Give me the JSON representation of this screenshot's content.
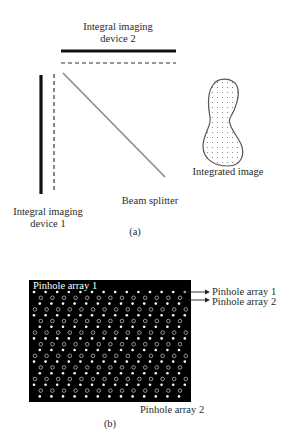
{
  "figure_a": {
    "caption": "(a)",
    "device2_label_line1": "Integral imaging",
    "device2_label_line2": "device 2",
    "device1_label_line1": "Integral imaging",
    "device1_label_line2": "device 1",
    "beam_splitter_label": "Beam splitter",
    "integrated_image_label": "Integrated image"
  },
  "figure_b": {
    "caption": "(b)",
    "inside_label": "Pinhole array 1",
    "arrow_label_1": "Pinhole array 1",
    "arrow_label_2": "Pinhole array 2",
    "bottom_label": "Pinhole array 2",
    "grid": {
      "columns": 14,
      "filled_rows": 10,
      "hollow_rows": 10
    }
  },
  "colors": {
    "ink": "#111111",
    "splitter": "#8a8a8a",
    "panel": "#000000",
    "pinhole": "#ffffff"
  }
}
